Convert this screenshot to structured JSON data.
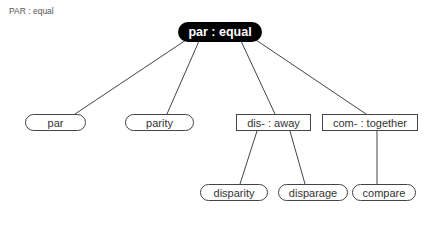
{
  "title": "PAR : equal",
  "root": {
    "label": "par : equal"
  },
  "level1": [
    {
      "label": "par",
      "shape": "rounded"
    },
    {
      "label": "parity",
      "shape": "rounded"
    },
    {
      "label": "dis- : away",
      "shape": "rect"
    },
    {
      "label": "com- : together",
      "shape": "rect"
    }
  ],
  "level2": [
    {
      "label": "disparity",
      "shape": "rounded",
      "parent": "dis- : away"
    },
    {
      "label": "disparage",
      "shape": "rounded",
      "parent": "dis- : away"
    },
    {
      "label": "compare",
      "shape": "rounded",
      "parent": "com- : together"
    }
  ],
  "colors": {
    "root_bg": "#000000",
    "line": "#444444",
    "title": "#555555"
  }
}
